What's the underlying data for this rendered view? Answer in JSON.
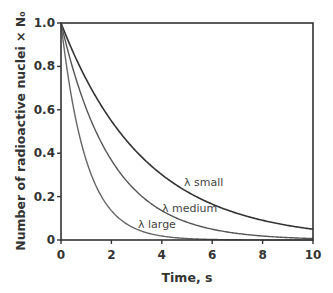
{
  "chart_data": {
    "type": "line",
    "title": "",
    "xlabel": "Time, s",
    "ylabel": "Number of radioactive nuclei × N₀",
    "xlim": [
      0,
      10
    ],
    "ylim": [
      0,
      1.0
    ],
    "x_ticks": [
      "0",
      "2",
      "4",
      "6",
      "8",
      "10"
    ],
    "y_ticks": [
      "0",
      "0.2",
      "0.4",
      "0.6",
      "0.8",
      "1.0"
    ],
    "grid": false,
    "legend": "inline labels",
    "x": [
      0,
      1,
      2,
      3,
      4,
      5,
      6,
      7,
      8,
      9,
      10
    ],
    "series": [
      {
        "name": "λ small",
        "label": "λ small",
        "decay_rate": 0.3,
        "color": "#333333",
        "values": [
          1.0,
          0.741,
          0.549,
          0.407,
          0.301,
          0.223,
          0.165,
          0.122,
          0.091,
          0.067,
          0.05
        ]
      },
      {
        "name": "λ medium",
        "label": "λ medium",
        "decay_rate": 0.5,
        "color": "#555555",
        "values": [
          1.0,
          0.607,
          0.368,
          0.223,
          0.135,
          0.082,
          0.05,
          0.03,
          0.018,
          0.011,
          0.007
        ]
      },
      {
        "name": "λ large",
        "label": "λ large",
        "decay_rate": 1.0,
        "color": "#666666",
        "values": [
          1.0,
          0.368,
          0.135,
          0.05,
          0.018,
          0.007,
          0.002,
          0.001,
          0.0,
          0.0,
          0.0
        ]
      }
    ]
  }
}
